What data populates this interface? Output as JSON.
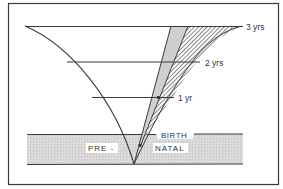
{
  "diagram": {
    "labels": {
      "three_years": "3 yrs",
      "two_years": "2 yrs",
      "one_year": "1 yr",
      "birth": "BIRTH",
      "pre": "PRE -",
      "natal": "NATAL"
    },
    "colors": {
      "line": "#3a3a3a",
      "prenatal_band": "#dcdcdc",
      "gray_wedge": "#d0d0d0",
      "hatch": "#444444",
      "background": "#ffffff"
    }
  }
}
